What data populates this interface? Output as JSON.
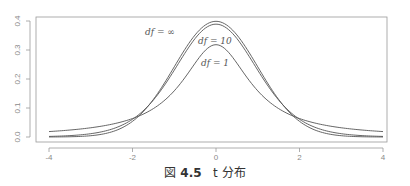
{
  "chart_data": {
    "type": "line",
    "title": "",
    "xlabel": "",
    "ylabel": "",
    "xlim": [
      -4,
      4
    ],
    "ylim": [
      0,
      0.4
    ],
    "x_ticks": [
      "-4",
      "-2",
      "0",
      "2",
      "4"
    ],
    "y_ticks": [
      "0.0",
      "0.1",
      "0.2",
      "0.3",
      "0.4"
    ],
    "grid": false,
    "legend": "none (curves labeled inline)",
    "series": [
      {
        "name": "df = ∞",
        "x": [
          -4,
          -3,
          -2,
          -1.5,
          -1,
          -0.5,
          0,
          0.5,
          1,
          1.5,
          2,
          3,
          4
        ],
        "values": [
          0.0001,
          0.0044,
          0.054,
          0.1295,
          0.242,
          0.3521,
          0.3989,
          0.3521,
          0.242,
          0.1295,
          0.054,
          0.0044,
          0.0001
        ]
      },
      {
        "name": "df = 10",
        "x": [
          -4,
          -3,
          -2,
          -1.5,
          -1,
          -0.5,
          0,
          0.5,
          1,
          1.5,
          2,
          3,
          4
        ],
        "values": [
          0.002,
          0.0114,
          0.0611,
          0.1274,
          0.2304,
          0.3397,
          0.3891,
          0.3397,
          0.2304,
          0.1274,
          0.0611,
          0.0114,
          0.002
        ]
      },
      {
        "name": "df = 1",
        "x": [
          -4,
          -3,
          -2,
          -1.5,
          -1,
          -0.5,
          0,
          0.5,
          1,
          1.5,
          2,
          3,
          4
        ],
        "values": [
          0.0187,
          0.0318,
          0.0637,
          0.0979,
          0.1592,
          0.2546,
          0.3183,
          0.2546,
          0.1592,
          0.0979,
          0.0637,
          0.0318,
          0.0187
        ]
      }
    ],
    "annotations": [
      "df = ∞",
      "df = 10",
      "df = 1"
    ]
  },
  "labels": {
    "df_inf": "df = ∞",
    "df_10": "df = 10",
    "df_1": "df = 1"
  },
  "caption": {
    "prefix": "図",
    "number": "4.5",
    "text": "t 分布"
  }
}
